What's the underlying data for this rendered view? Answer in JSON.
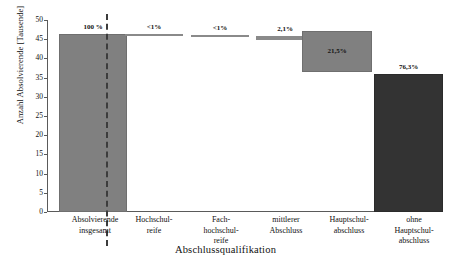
{
  "chart_data": {
    "type": "bar",
    "subtype": "waterfall",
    "title": "",
    "xlabel": "Abschlussqualifikation",
    "ylabel": "Anzahl Absolvierende [Tausende]",
    "ylim": [
      0,
      50
    ],
    "yticks": [
      0,
      5,
      10,
      15,
      20,
      25,
      30,
      35,
      40,
      45,
      50
    ],
    "grid": false,
    "legend": null,
    "categories": [
      "Absolvierende insgesamt",
      "Hochschulreife",
      "Fachhochschulreife",
      "mittlerer Abschluss",
      "Hauptschulabschluss",
      "ohne Hauptschulabschluss"
    ],
    "data_labels": [
      "100 %",
      "<1%",
      "<1%",
      "2,1%",
      "21,5%",
      "76,3%"
    ],
    "percent_values": [
      100.0,
      0.5,
      0.5,
      2.1,
      21.5,
      76.3
    ],
    "values_thousands": [
      46.5,
      0.2,
      0.2,
      1.0,
      10.0,
      35.5
    ],
    "segment_bases_thousands": [
      0.0,
      46.3,
      46.1,
      45.1,
      35.5,
      0.0
    ],
    "segment_tops_thousands": [
      46.5,
      46.5,
      46.3,
      46.1,
      45.5,
      35.5
    ]
  },
  "axes": {
    "y_title": "Anzahl Absolvierende [Tausende]",
    "x_title": "Abschlussqualifikation",
    "y_tick_labels": [
      "50",
      "45",
      "40",
      "35",
      "30",
      "25",
      "20",
      "15",
      "10",
      "5",
      "0"
    ]
  },
  "bars": [
    {
      "name": "absolvierende-insgesamt",
      "label": "100 %",
      "label_position": "above",
      "style": "light",
      "left": 12,
      "width": 68,
      "top": 14,
      "height": 178
    },
    {
      "name": "hochschulreife",
      "label": "<1%",
      "label_position": "above",
      "style": "sliver",
      "left": 78,
      "width": 58,
      "top": 14,
      "height": 2
    },
    {
      "name": "fachhochschulreife",
      "label": "<1%",
      "label_position": "above",
      "style": "sliver",
      "left": 144,
      "width": 58,
      "top": 15,
      "height": 2
    },
    {
      "name": "mittlerer-abschluss",
      "label": "2,1%",
      "label_position": "above",
      "style": "sliver",
      "left": 209,
      "width": 58,
      "top": 16,
      "height": 4
    },
    {
      "name": "hauptschulabschluss",
      "label": "21,5%",
      "label_position": "inside",
      "style": "light",
      "left": 255,
      "width": 70,
      "top": 11,
      "height": 41
    },
    {
      "name": "ohne-hauptschulabschluss",
      "label": "76,3%",
      "label_position": "above",
      "style": "dark",
      "left": 327,
      "width": 69,
      "top": 54,
      "height": 138
    }
  ],
  "category_labels": [
    {
      "name": "absolvierende-insgesamt",
      "left": -2,
      "width": 100,
      "lines": [
        "Absolvierende",
        "insgesamt"
      ]
    },
    {
      "name": "hochschulreife",
      "left": 73,
      "width": 68,
      "lines": [
        "Hochschul-",
        "reife"
      ]
    },
    {
      "name": "fachhochschulreife",
      "left": 141,
      "width": 66,
      "lines": [
        "Fach-",
        "hochschul-",
        "reife"
      ]
    },
    {
      "name": "mittlerer-abschluss",
      "left": 203,
      "width": 72,
      "lines": [
        "mittlerer",
        "Abschluss"
      ]
    },
    {
      "name": "hauptschulabschluss",
      "left": 263,
      "width": 78,
      "lines": [
        "Hauptschul-",
        "abschluss"
      ]
    },
    {
      "name": "ohne-hauptschulabschluss",
      "left": 332,
      "width": 70,
      "lines": [
        "ohne",
        "Hauptschul-",
        "abschluss"
      ]
    }
  ],
  "colors": {
    "bar_light": "#808080",
    "bar_dark": "#333333",
    "axis": "#5a5a5a",
    "separator": "#3c3c3c",
    "text": "#111111",
    "background": "#ffffff"
  }
}
